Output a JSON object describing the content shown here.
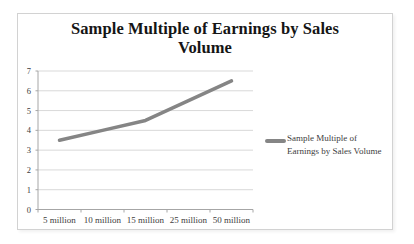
{
  "chart_data": {
    "type": "line",
    "title": "Sample Multiple of Earnings by Sales Volume",
    "title_lines": [
      "Sample Multiple of Earnings by Sales",
      "Volume"
    ],
    "categories": [
      "5 million",
      "10 million",
      "15 million",
      "25 million",
      "50 million"
    ],
    "series": [
      {
        "name": "Sample Multiple of Earnings by Sales Volume",
        "values": [
          3.5,
          4,
          4.5,
          5.5,
          6.5
        ]
      }
    ],
    "xlabel": "",
    "ylabel": "",
    "ylim": [
      0,
      7
    ],
    "y_ticks": [
      0,
      1,
      2,
      3,
      4,
      5,
      6,
      7
    ],
    "grid": true,
    "legend": {
      "position": "right",
      "label": "Sample Multiple of Earnings by Sales Volume",
      "label_lines": [
        "Sample Multiple of",
        "Earnings by Sales Volume"
      ]
    },
    "colors": {
      "series": "#858585",
      "gridline": "#d9d9d9",
      "axis": "#a6a6a6",
      "tick_text": "#404040",
      "title_text": "#151515",
      "frame_border": "#d2d2d2"
    }
  }
}
